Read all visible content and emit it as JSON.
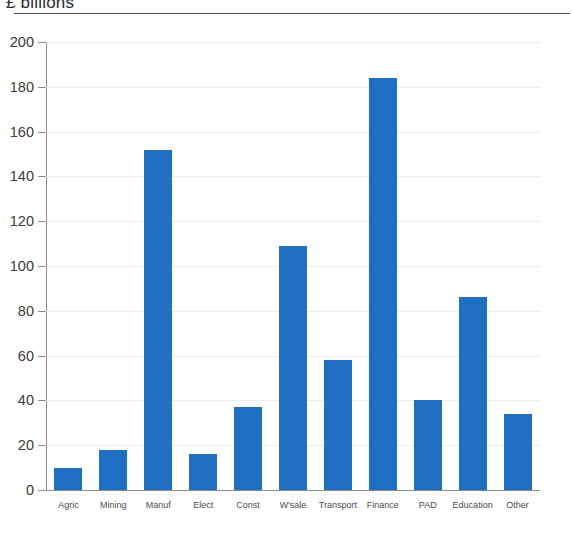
{
  "chart_data": {
    "type": "bar",
    "title": "£ billions",
    "xlabel": "",
    "ylabel": "",
    "ylim": [
      0,
      200
    ],
    "ytick_step": 20,
    "yticks": [
      200,
      180,
      160,
      140,
      120,
      100,
      80,
      60,
      40,
      20,
      0
    ],
    "grid": true,
    "legend": "none",
    "bar_color": "#1f6fc4",
    "categories": [
      "Agric",
      "Mining",
      "Manuf",
      "Elect",
      "Const",
      "W'sale",
      "Transport",
      "Finance",
      "PAD",
      "Education",
      "Other"
    ],
    "values": [
      10,
      18,
      152,
      16,
      37,
      109,
      58,
      184,
      40,
      86,
      34
    ]
  },
  "axis": {
    "y_labels": [
      "200",
      "180",
      "160",
      "140",
      "120",
      "100",
      "80",
      "60",
      "40",
      "20",
      "0"
    ],
    "x_labels": [
      "Agric",
      "Mining",
      "Manuf",
      "Elect",
      "Const",
      "W'sale",
      "Transport",
      "Finance",
      "PAD",
      "Education",
      "Other"
    ]
  },
  "title": {
    "text": "£ billions"
  }
}
